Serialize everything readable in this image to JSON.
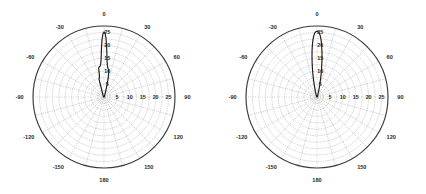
{
  "figure": {
    "title": "",
    "panel_count": 2,
    "background_color": "#ffffff",
    "curve_color": "#1a1a1a",
    "grid_color": "#b9b9b9",
    "outer_circle_color": "#3a3a3a"
  },
  "chart_data": [
    {
      "type": "line",
      "plot_kind": "polar",
      "panel": "left",
      "title": "",
      "subtitle": "",
      "xlabel": "",
      "ylabel": "",
      "angle_unit": "degrees",
      "angle_tick_labels": [
        "0",
        "30",
        "60",
        "90",
        "120",
        "150",
        "180",
        "-150",
        "-120",
        "-90",
        "-60",
        "-30"
      ],
      "angle_ticks": [
        0,
        30,
        60,
        90,
        120,
        150,
        180,
        -150,
        -120,
        -90,
        -60,
        -30
      ],
      "angle_minor_step": 15,
      "angle_zero_location": "N",
      "angle_direction": "clockwise",
      "radial_tick_labels": [
        "5",
        "10",
        "15",
        "20",
        "25"
      ],
      "radial_ticks": [
        5,
        10,
        15,
        20,
        25
      ],
      "radial_label_angles": [
        0,
        90
      ],
      "rlim": [
        0,
        27.5
      ],
      "radial_minor_step": 2.5,
      "grid": true,
      "legend": "none",
      "annotations": [],
      "series": [
        {
          "name": "radiation-pattern-left",
          "theta": [
            -180,
            -150,
            -120,
            -100,
            -90,
            -80,
            -70,
            -60,
            -50,
            -40,
            -32,
            -26,
            -22,
            -19,
            -17.5,
            -16.5,
            -16,
            -15.5,
            -15,
            -14,
            -13,
            -12,
            -11,
            -10.5,
            -10,
            -9.5,
            -9,
            -8,
            -7,
            -6,
            -5,
            -4,
            -3,
            -2,
            -1,
            0,
            1,
            2,
            3,
            4,
            5,
            6,
            7,
            8,
            9,
            10,
            11,
            12,
            13,
            14,
            15,
            16,
            17,
            18,
            20,
            24,
            30,
            40,
            50,
            60,
            70,
            80,
            90,
            100,
            120,
            150,
            180
          ],
          "r": [
            0.0,
            0.0,
            0.0,
            0.05,
            0.1,
            0.1,
            0.15,
            0.2,
            0.3,
            0.4,
            0.6,
            0.9,
            1.4,
            2.2,
            3.2,
            4.6,
            6.0,
            7.0,
            7.4,
            7.6,
            7.8,
            8.4,
            10.2,
            11.4,
            11.6,
            11.7,
            11.8,
            11.9,
            12.1,
            12.6,
            13.6,
            15.6,
            18.8,
            22.2,
            24.4,
            25.2,
            24.6,
            22.6,
            19.4,
            16.2,
            13.8,
            12.4,
            11.6,
            11.2,
            10.9,
            10.4,
            9.4,
            8.0,
            6.4,
            4.8,
            3.4,
            2.4,
            1.7,
            1.2,
            0.7,
            0.4,
            0.25,
            0.15,
            0.1,
            0.1,
            0.05,
            0.05,
            0.05,
            0.05,
            0.0,
            0.0,
            0.0
          ]
        }
      ]
    },
    {
      "type": "line",
      "plot_kind": "polar",
      "panel": "right",
      "title": "",
      "subtitle": "",
      "xlabel": "",
      "ylabel": "",
      "angle_unit": "degrees",
      "angle_tick_labels": [
        "0",
        "30",
        "60",
        "90",
        "120",
        "150",
        "180",
        "-150",
        "-120",
        "-90",
        "-60",
        "-30"
      ],
      "angle_ticks": [
        0,
        30,
        60,
        90,
        120,
        150,
        180,
        -150,
        -120,
        -90,
        -60,
        -30
      ],
      "angle_minor_step": 15,
      "angle_zero_location": "N",
      "angle_direction": "clockwise",
      "radial_tick_labels": [
        "5",
        "10",
        "15",
        "20",
        "25"
      ],
      "radial_ticks": [
        5,
        10,
        15,
        20,
        25
      ],
      "radial_label_angles": [
        0,
        90
      ],
      "rlim": [
        0,
        27.5
      ],
      "radial_minor_step": 2.5,
      "grid": true,
      "legend": "none",
      "annotations": [],
      "series": [
        {
          "name": "radiation-pattern-right",
          "theta": [
            -180,
            -150,
            -120,
            -90,
            -60,
            -40,
            -30,
            -24,
            -20,
            -17,
            -15,
            -13,
            -11,
            -10,
            -9,
            -8,
            -7,
            -6,
            -5,
            -4,
            -3,
            -2,
            -1,
            0,
            1,
            2,
            3,
            4,
            5,
            6,
            7,
            8,
            9,
            10,
            11,
            13,
            15,
            17,
            20,
            24,
            30,
            40,
            60,
            90,
            120,
            150,
            180
          ],
          "r": [
            0.0,
            0.0,
            0.0,
            0.05,
            0.1,
            0.2,
            0.35,
            0.6,
            1.0,
            1.8,
            2.8,
            4.6,
            7.6,
            9.4,
            11.4,
            13.6,
            15.9,
            18.2,
            20.4,
            22.3,
            23.8,
            24.8,
            25.3,
            25.5,
            25.3,
            24.8,
            23.8,
            22.3,
            20.4,
            18.2,
            15.9,
            13.6,
            11.4,
            9.4,
            7.6,
            4.6,
            2.8,
            1.8,
            1.0,
            0.6,
            0.35,
            0.2,
            0.1,
            0.05,
            0.0,
            0.0,
            0.0
          ]
        }
      ]
    }
  ]
}
